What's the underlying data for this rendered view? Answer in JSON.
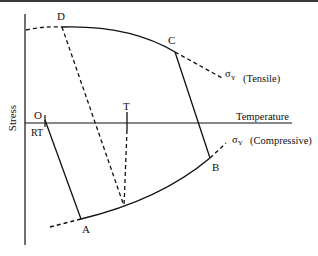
{
  "diagram": {
    "axes": {
      "y_label": "Stress",
      "x_label": "Temperature",
      "origin_label": "O",
      "rt_label": "RT"
    },
    "points": {
      "D": "D",
      "C": "C",
      "T": "T",
      "A": "A",
      "B": "B"
    },
    "curves": {
      "tensile_symbol": "σ",
      "tensile_sub": "Y",
      "tensile_label": "(Tensile)",
      "compressive_symbol": "σ",
      "compressive_sub": "Y",
      "compressive_label": "(Compressive)"
    },
    "colors": {
      "line": "#111111",
      "background": "#ffffff"
    }
  }
}
